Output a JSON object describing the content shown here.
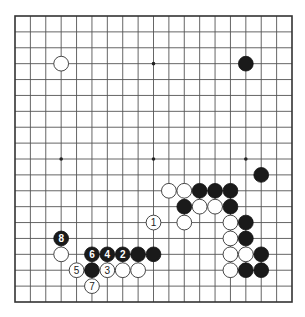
{
  "board": {
    "size": 19,
    "origin_px": {
      "x": 15,
      "y": 16
    },
    "end_px": {
      "x": 292,
      "y": 302
    },
    "colors": {
      "line": "#555555",
      "border": "#333333",
      "black": "#1a1a1a",
      "white": "#ffffff",
      "background": "#ffffff"
    },
    "star_points": [
      [
        3,
        3
      ],
      [
        9,
        3
      ],
      [
        15,
        3
      ],
      [
        3,
        9
      ],
      [
        9,
        9
      ],
      [
        15,
        9
      ],
      [
        3,
        15
      ],
      [
        9,
        15
      ],
      [
        15,
        15
      ]
    ],
    "stones": [
      {
        "color": "white",
        "col": 3,
        "row": 3,
        "label": ""
      },
      {
        "color": "black",
        "col": 15,
        "row": 3,
        "label": ""
      },
      {
        "color": "black",
        "col": 16,
        "row": 10,
        "label": ""
      },
      {
        "color": "white",
        "col": 10,
        "row": 11,
        "label": ""
      },
      {
        "color": "white",
        "col": 11,
        "row": 11,
        "label": ""
      },
      {
        "color": "black",
        "col": 12,
        "row": 11,
        "label": ""
      },
      {
        "color": "black",
        "col": 13,
        "row": 11,
        "label": ""
      },
      {
        "color": "black",
        "col": 14,
        "row": 11,
        "label": ""
      },
      {
        "color": "black",
        "col": 11,
        "row": 12,
        "label": ""
      },
      {
        "color": "white",
        "col": 12,
        "row": 12,
        "label": ""
      },
      {
        "color": "white",
        "col": 13,
        "row": 12,
        "label": ""
      },
      {
        "color": "black",
        "col": 14,
        "row": 12,
        "label": ""
      },
      {
        "color": "white",
        "col": 9,
        "row": 13,
        "label": "1"
      },
      {
        "color": "white",
        "col": 11,
        "row": 13,
        "label": ""
      },
      {
        "color": "white",
        "col": 14,
        "row": 13,
        "label": ""
      },
      {
        "color": "black",
        "col": 15,
        "row": 13,
        "label": ""
      },
      {
        "color": "black",
        "col": 3,
        "row": 14,
        "label": "8"
      },
      {
        "color": "white",
        "col": 14,
        "row": 14,
        "label": ""
      },
      {
        "color": "black",
        "col": 15,
        "row": 14,
        "label": ""
      },
      {
        "color": "white",
        "col": 3,
        "row": 15,
        "label": ""
      },
      {
        "color": "black",
        "col": 5,
        "row": 15,
        "label": "6"
      },
      {
        "color": "black",
        "col": 6,
        "row": 15,
        "label": "4"
      },
      {
        "color": "black",
        "col": 7,
        "row": 15,
        "label": "2"
      },
      {
        "color": "black",
        "col": 8,
        "row": 15,
        "label": ""
      },
      {
        "color": "black",
        "col": 9,
        "row": 15,
        "label": ""
      },
      {
        "color": "white",
        "col": 14,
        "row": 15,
        "label": ""
      },
      {
        "color": "white",
        "col": 15,
        "row": 15,
        "label": ""
      },
      {
        "color": "black",
        "col": 16,
        "row": 15,
        "label": ""
      },
      {
        "color": "white",
        "col": 4,
        "row": 16,
        "label": "5"
      },
      {
        "color": "black",
        "col": 5,
        "row": 16,
        "label": ""
      },
      {
        "color": "white",
        "col": 6,
        "row": 16,
        "label": "3"
      },
      {
        "color": "white",
        "col": 7,
        "row": 16,
        "label": ""
      },
      {
        "color": "white",
        "col": 8,
        "row": 16,
        "label": ""
      },
      {
        "color": "white",
        "col": 14,
        "row": 16,
        "label": ""
      },
      {
        "color": "black",
        "col": 15,
        "row": 16,
        "label": ""
      },
      {
        "color": "black",
        "col": 16,
        "row": 16,
        "label": ""
      },
      {
        "color": "white",
        "col": 5,
        "row": 17,
        "label": "7"
      }
    ]
  }
}
